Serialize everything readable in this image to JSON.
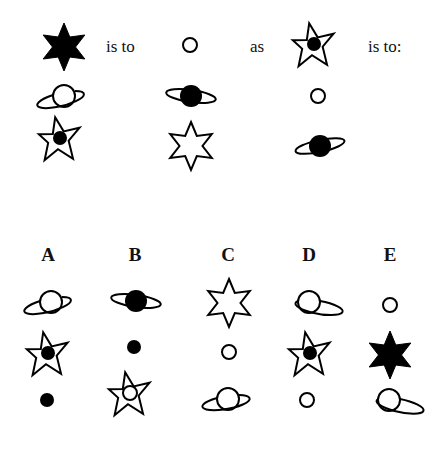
{
  "question": {
    "row1": {
      "term_a": "filled-six-point-star",
      "text_is_to": "is to",
      "term_b": "small-hollow-circle",
      "text_as": "as",
      "term_c": "five-point-star-with-dot",
      "text_is_to_colon": "is to:"
    },
    "grid": [
      [
        "hollow-ringed-planet",
        "filled-ringed-planet",
        "small-hollow-circle"
      ],
      [
        "five-point-star-with-dot",
        "hollow-six-point-star",
        "filled-ringed-planet"
      ]
    ]
  },
  "options": [
    {
      "label": "A",
      "symbols": [
        "hollow-ringed-planet",
        "five-point-star-with-dot",
        "small-filled-dot"
      ]
    },
    {
      "label": "B",
      "symbols": [
        "filled-ringed-planet",
        "small-filled-dot",
        "five-point-star-with-circle"
      ]
    },
    {
      "label": "C",
      "symbols": [
        "hollow-six-point-star",
        "small-hollow-circle",
        "hollow-ringed-planet"
      ]
    },
    {
      "label": "D",
      "symbols": [
        "hollow-ringed-planet",
        "five-point-star-with-dot",
        "small-hollow-circle"
      ]
    },
    {
      "label": "E",
      "symbols": [
        "small-hollow-circle",
        "filled-six-point-star",
        "hollow-ringed-planet"
      ]
    }
  ],
  "colors": {
    "ink": "#000000",
    "background": "#ffffff"
  }
}
